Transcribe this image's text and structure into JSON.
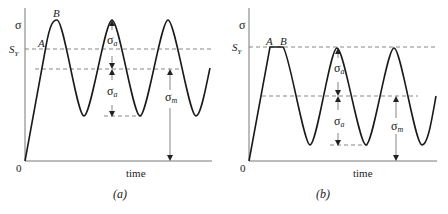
{
  "panels": [
    {
      "id": "a",
      "caption": "(a)",
      "y_axis_label": "σ",
      "x_axis_label": "time",
      "origin_label": "0",
      "yield_label_main": "S",
      "yield_label_sub": "Y",
      "point_labels": [
        "A",
        "B"
      ],
      "amplitude_label_main": "σ",
      "amplitude_label_sub": "a",
      "mean_label_main": "σ",
      "mean_label_sub": "m"
    },
    {
      "id": "b",
      "caption": "(b)",
      "y_axis_label": "σ",
      "x_axis_label": "time",
      "origin_label": "0",
      "yield_label_main": "S",
      "yield_label_sub": "Y",
      "point_labels": [
        "A",
        "B"
      ],
      "amplitude_label_main": "σ",
      "amplitude_label_sub": "a",
      "mean_label_main": "σ",
      "mean_label_sub": "m"
    }
  ],
  "colors": {
    "curve": "#1a1a1a",
    "axis": "#444444",
    "dashed": "#555555",
    "text": "#222222"
  }
}
